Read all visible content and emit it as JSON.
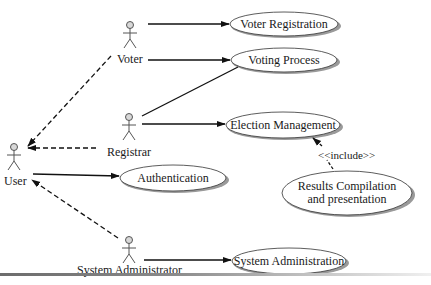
{
  "diagram": {
    "type": "uml-use-case",
    "actors": [
      {
        "id": "voter",
        "label": "Voter"
      },
      {
        "id": "registrar",
        "label": "Registrar"
      },
      {
        "id": "user",
        "label": "User"
      },
      {
        "id": "sysadmin",
        "label": "System Administrator"
      }
    ],
    "use_cases": [
      {
        "id": "voter_registration",
        "label": "Voter Registration"
      },
      {
        "id": "voting_process",
        "label": "Voting Process"
      },
      {
        "id": "election_management",
        "label": "Election Management"
      },
      {
        "id": "authentication",
        "label": "Authentication"
      },
      {
        "id": "results_compilation",
        "label_line1": "Results Compilation",
        "label_line2": "and presentation"
      },
      {
        "id": "system_administration",
        "label": "System Administration"
      }
    ],
    "relations": [
      {
        "from": "voter",
        "to": "voter_registration",
        "kind": "association"
      },
      {
        "from": "voter",
        "to": "voting_process",
        "kind": "association"
      },
      {
        "from": "registrar",
        "to": "voting_process",
        "kind": "association"
      },
      {
        "from": "registrar",
        "to": "election_management",
        "kind": "association"
      },
      {
        "from": "user",
        "to": "authentication",
        "kind": "association"
      },
      {
        "from": "sysadmin",
        "to": "system_administration",
        "kind": "association"
      },
      {
        "from": "voter",
        "to": "user",
        "kind": "generalization"
      },
      {
        "from": "registrar",
        "to": "user",
        "kind": "generalization"
      },
      {
        "from": "sysadmin",
        "to": "user",
        "kind": "generalization"
      },
      {
        "from": "results_compilation",
        "to": "election_management",
        "kind": "include",
        "label": "<<include>>"
      }
    ],
    "include_label": "<<include>>",
    "colors": {
      "line": "#111111",
      "ellipse_stroke": "#333333",
      "ellipse_shadow": "#9a9a9a",
      "actor_head_fill": "#d8d8d8",
      "actor_stroke": "#555555"
    }
  }
}
